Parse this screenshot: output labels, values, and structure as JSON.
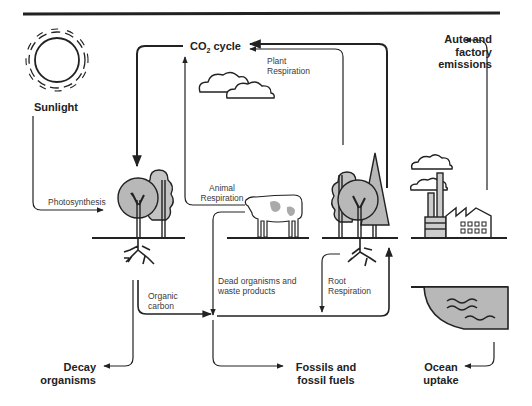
{
  "diagram": {
    "title_rule": true,
    "colors": {
      "line": "#222222",
      "fill_gray": "#b8b8b8",
      "background": "#ffffff"
    },
    "nodes": {
      "sunlight": {
        "label": "Sunlight",
        "icon": "sun-icon"
      },
      "co2_cycle": {
        "label_prefix": "CO",
        "label_sub": "2",
        "label_suffix": " cycle"
      },
      "plant_respiration": {
        "line1": "Plant",
        "line2": "Respiration"
      },
      "auto_factory": {
        "line1": "Auto and",
        "line2": "factory",
        "line3": "emissions"
      },
      "photosynthesis": {
        "label": "Photosynthesis"
      },
      "animal_respiration": {
        "line1": "Animal",
        "line2": "Respiration"
      },
      "organic_carbon": {
        "line1": "Organic",
        "line2": "carbon"
      },
      "dead_organisms": {
        "line1": "Dead organisms and",
        "line2": "waste products"
      },
      "root_respiration": {
        "line1": "Root",
        "line2": "Respiration"
      },
      "decay": {
        "line1": "Decay",
        "line2": "organisms"
      },
      "fossils": {
        "line1": "Fossils and",
        "line2": "fossil fuels"
      },
      "ocean": {
        "line1": "Ocean",
        "line2": "uptake"
      }
    },
    "icons": [
      "sun-icon",
      "cloud-icon",
      "tree-icon",
      "cow-icon",
      "factory-icon",
      "ocean-icon",
      "roots-icon"
    ]
  }
}
